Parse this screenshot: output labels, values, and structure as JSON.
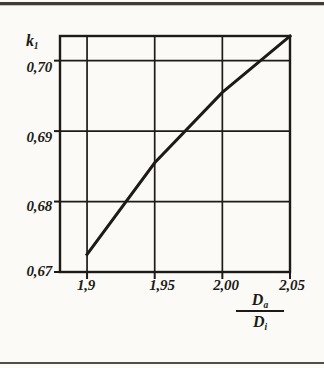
{
  "figure": {
    "name": "k1-vs-diameter-ratio-chart",
    "background_color": "#fbfaf6",
    "ink_color": "#1d1a17"
  },
  "chart_data": {
    "type": "line",
    "title": "",
    "subtitle": "",
    "xlabel": "Da/Di",
    "xlabel_numerator": "D",
    "xlabel_numerator_sub": "a",
    "xlabel_denominator": "D",
    "xlabel_denominator_sub": "i",
    "ylabel": "k1",
    "ylabel_base": "k",
    "ylabel_sub": "1",
    "x_ticks": [
      "1,9",
      "1,95",
      "2,00",
      "2,05"
    ],
    "x_tick_values": [
      1.9,
      1.95,
      2.0,
      2.05
    ],
    "y_ticks": [
      "0,67",
      "0,68",
      "0,69",
      "0,70"
    ],
    "y_tick_values": [
      0.67,
      0.68,
      0.69,
      0.7
    ],
    "xlim": [
      1.88,
      2.05
    ],
    "ylim": [
      0.67,
      0.7035
    ],
    "grid": true,
    "grid_x_at": [
      1.9,
      1.95,
      2.0
    ],
    "grid_y_at": [
      0.68,
      0.69,
      0.7
    ],
    "legend": null,
    "legend_position": "none",
    "series": [
      {
        "name": "k1",
        "x": [
          1.9,
          1.95,
          2.0,
          2.05
        ],
        "values": [
          0.6725,
          0.6855,
          0.6955,
          0.7035
        ],
        "line_width": 3,
        "color": "#1d1a17"
      }
    ],
    "annotations": []
  },
  "decorations": {
    "top_rule": "horizontal-rule",
    "bottom_rule": "horizontal-rule"
  }
}
